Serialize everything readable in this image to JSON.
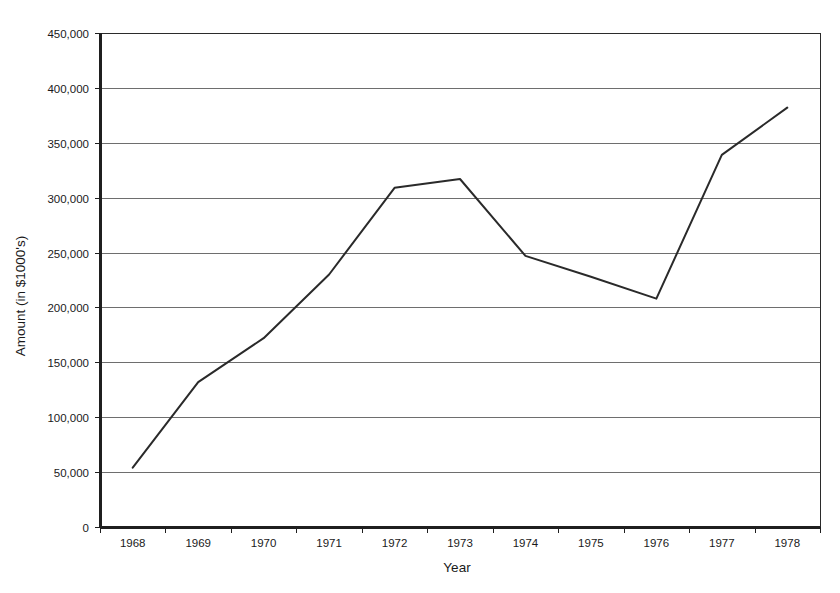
{
  "chart_data": {
    "type": "line",
    "title": "",
    "xlabel": "Year",
    "ylabel": "Amount (in $1000's)",
    "categories": [
      "1968",
      "1969",
      "1970",
      "1971",
      "1972",
      "1973",
      "1974",
      "1975",
      "1976",
      "1977",
      "1978"
    ],
    "values": [
      54000,
      132000,
      172000,
      230000,
      309000,
      317000,
      247000,
      228000,
      208000,
      339000,
      382000
    ],
    "series": [
      {
        "name": "Amount",
        "values": [
          54000,
          132000,
          172000,
          230000,
          309000,
          317000,
          247000,
          228000,
          208000,
          339000,
          382000
        ]
      }
    ],
    "ylim": [
      0,
      450000
    ],
    "ytick_labels": [
      "0",
      "50,000",
      "100,000",
      "150,000",
      "200,000",
      "250,000",
      "300,000",
      "350,000",
      "400,000",
      "450,000"
    ],
    "ytick_values": [
      0,
      50000,
      100000,
      150000,
      200000,
      250000,
      300000,
      350000,
      400000,
      450000
    ],
    "xtick_labels": [
      "1968",
      "1969",
      "1970",
      "1971",
      "1972",
      "1973",
      "1974",
      "1975",
      "1976",
      "1977",
      "1978"
    ],
    "grid": "horizontal",
    "legend": "none",
    "line_color": "#2a2a2a",
    "grid_color": "#6e6e6e",
    "background_color": "#ffffff"
  }
}
